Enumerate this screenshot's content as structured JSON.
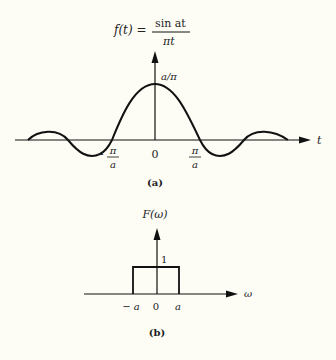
{
  "figure_a": {
    "formula_lhs": "f(t) =",
    "formula_num": "sin at",
    "formula_den": "πt",
    "peak_label": "a/π",
    "x_axis_label": "t",
    "tick_neg": "−",
    "tick_neg_num": "π",
    "tick_neg_den": "a",
    "tick_zero": "0",
    "tick_pos_num": "π",
    "tick_pos_den": "a",
    "caption": "(a)"
  },
  "figure_b": {
    "y_axis_label": "F(ω)",
    "height_label": "1",
    "x_axis_label": "ω",
    "tick_neg": "− a",
    "tick_zero": "0",
    "tick_pos": "a",
    "caption": "(b)"
  },
  "colors": {
    "line": "#111111",
    "background": "#fdfdf6"
  }
}
